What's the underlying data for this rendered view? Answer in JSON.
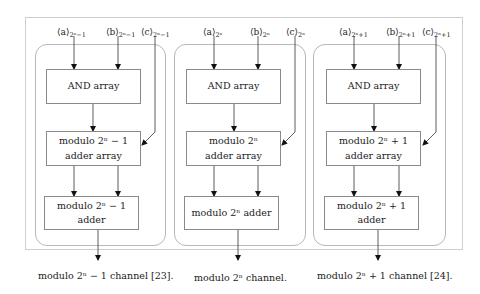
{
  "figure": {
    "channels": [
      {
        "id": "minus",
        "inputs": [
          {
            "name": "a",
            "label": "⟨a⟩",
            "sub": "2ⁿ−1"
          },
          {
            "name": "b",
            "label": "⟨b⟩",
            "sub": "2ⁿ−1"
          },
          {
            "name": "c",
            "label": "⟨c⟩",
            "sub": "2ⁿ−1"
          }
        ],
        "and_block": "AND array",
        "adder_array_line1": "modulo 2ⁿ − 1",
        "adder_array_line2": "adder array",
        "adder_block": "modulo 2ⁿ − 1 adder",
        "caption": "modulo 2ⁿ − 1 channel [23]."
      },
      {
        "id": "plain",
        "inputs": [
          {
            "name": "a",
            "label": "⟨a⟩",
            "sub": "2ⁿ"
          },
          {
            "name": "b",
            "label": "⟨b⟩",
            "sub": "2ⁿ"
          },
          {
            "name": "c",
            "label": "⟨c⟩",
            "sub": "2ⁿ"
          }
        ],
        "and_block": "AND array",
        "adder_array_line1": "modulo 2ⁿ",
        "adder_array_line2": "adder array",
        "adder_block": "modulo 2ⁿ adder",
        "caption": "modulo 2ⁿ channel."
      },
      {
        "id": "plus",
        "inputs": [
          {
            "name": "a",
            "label": "⟨a⟩",
            "sub": "2ⁿ+1"
          },
          {
            "name": "b",
            "label": "⟨b⟩",
            "sub": "2ⁿ+1"
          },
          {
            "name": "c",
            "label": "⟨c⟩",
            "sub": "2ⁿ+1"
          }
        ],
        "and_block": "AND array",
        "adder_array_line1": "modulo 2ⁿ + 1",
        "adder_array_line2": "adder array",
        "adder_block": "modulo 2ⁿ + 1 adder",
        "caption": "modulo 2ⁿ + 1 channel [24]."
      }
    ]
  }
}
